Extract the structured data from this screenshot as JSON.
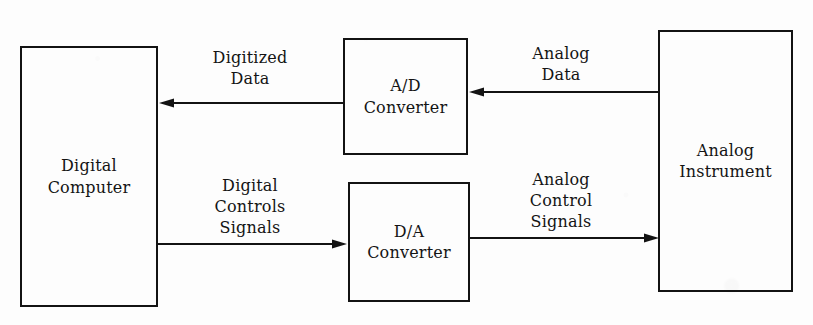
{
  "diagram": {
    "background_color": "#fdfdfd",
    "ink_color": "#131313",
    "nodes": [
      {
        "id": "digital-computer",
        "label": "Digital\nComputer",
        "x": 20,
        "y": 46,
        "width": 138,
        "height": 261
      },
      {
        "id": "ad-converter",
        "label": "A/D\nConverter",
        "x": 343,
        "y": 38,
        "width": 125,
        "height": 117
      },
      {
        "id": "da-converter",
        "label": "D/A\nConverter",
        "x": 348,
        "y": 182,
        "width": 122,
        "height": 120
      },
      {
        "id": "analog-instrument",
        "label": "Analog\nInstrument",
        "x": 658,
        "y": 30,
        "width": 135,
        "height": 262
      }
    ],
    "edges": [
      {
        "id": "digitized-data",
        "label": "Digitized\nData",
        "from": "ad-converter",
        "to": "digital-computer",
        "direction": "left",
        "label_x": 250,
        "label_y": 48,
        "line_y": 103,
        "x_start": 343,
        "x_end": 159
      },
      {
        "id": "analog-data",
        "label": "Analog\nData",
        "from": "analog-instrument",
        "to": "ad-converter",
        "direction": "left",
        "label_x": 561,
        "label_y": 44,
        "line_y": 92,
        "x_start": 658,
        "x_end": 469
      },
      {
        "id": "digital-controls-signals",
        "label": "Digital\nControls\nSignals",
        "from": "digital-computer",
        "to": "da-converter",
        "direction": "right",
        "label_x": 250,
        "label_y": 176,
        "line_y": 244,
        "x_start": 157,
        "x_end": 347
      },
      {
        "id": "analog-control-signals",
        "label": "Analog\nControl\nSignals",
        "from": "da-converter",
        "to": "analog-instrument",
        "direction": "right",
        "label_x": 561,
        "label_y": 170,
        "line_y": 238,
        "x_start": 470,
        "x_end": 659
      }
    ]
  }
}
